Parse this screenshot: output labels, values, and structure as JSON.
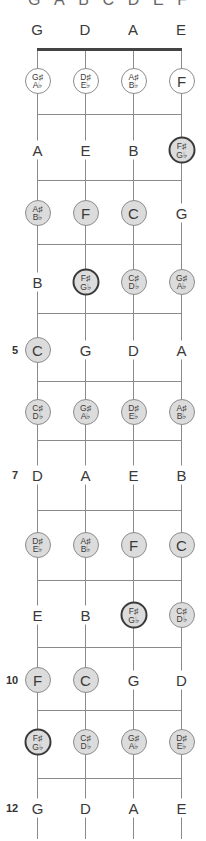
{
  "top_letters": [
    "G",
    "A",
    "B",
    "C",
    "D",
    "E",
    "F"
  ],
  "strings": [
    {
      "name": "G",
      "x": 37
    },
    {
      "name": "D",
      "x": 85
    },
    {
      "name": "A",
      "x": 133
    },
    {
      "name": "E",
      "x": 181
    }
  ],
  "open_strings": [
    "G",
    "D",
    "A",
    "E"
  ],
  "fret_lines_y": [
    114,
    180,
    244,
    313,
    381,
    440,
    510,
    580,
    647,
    710,
    778
  ],
  "fret_markers": [
    {
      "fret": "5",
      "y": 350
    },
    {
      "fret": "7",
      "y": 475
    },
    {
      "fret": "10",
      "y": 680
    },
    {
      "fret": "12",
      "y": 808
    }
  ],
  "frets": [
    {
      "fret": 1,
      "y": 81,
      "notes": [
        {
          "label": "G♯/A♭",
          "sharp": "G♯",
          "flat": "A♭",
          "style": "open-circle"
        },
        {
          "label": "D♯/E♭",
          "sharp": "D♯",
          "flat": "E♭",
          "style": "open-circle"
        },
        {
          "label": "A♯/B♭",
          "sharp": "A♯",
          "flat": "B♭",
          "style": "open-circle"
        },
        {
          "label": "F",
          "style": "open-circle"
        }
      ]
    },
    {
      "fret": 2,
      "y": 150,
      "notes": [
        {
          "label": "A",
          "style": "plain"
        },
        {
          "label": "E",
          "style": "plain"
        },
        {
          "label": "B",
          "style": "plain"
        },
        {
          "label": "F♯/G♭",
          "sharp": "F♯",
          "flat": "G♭",
          "style": "bold-circle"
        }
      ]
    },
    {
      "fret": 3,
      "y": 213,
      "notes": [
        {
          "label": "A♯/B♭",
          "sharp": "A♯",
          "flat": "B♭",
          "style": "circle"
        },
        {
          "label": "F",
          "style": "circle"
        },
        {
          "label": "C",
          "style": "circle"
        },
        {
          "label": "G",
          "style": "plain"
        }
      ]
    },
    {
      "fret": 4,
      "y": 282,
      "notes": [
        {
          "label": "B",
          "style": "plain"
        },
        {
          "label": "F♯/G♭",
          "sharp": "F♯",
          "flat": "G♭",
          "style": "bold-circle"
        },
        {
          "label": "C♯/D♭",
          "sharp": "C♯",
          "flat": "D♭",
          "style": "circle"
        },
        {
          "label": "G♯/A♭",
          "sharp": "G♯",
          "flat": "A♭",
          "style": "circle"
        }
      ]
    },
    {
      "fret": 5,
      "y": 350,
      "notes": [
        {
          "label": "C",
          "style": "circle"
        },
        {
          "label": "G",
          "style": "plain"
        },
        {
          "label": "D",
          "style": "plain"
        },
        {
          "label": "A",
          "style": "plain"
        }
      ]
    },
    {
      "fret": 6,
      "y": 412,
      "notes": [
        {
          "label": "C♯/D♭",
          "sharp": "C♯",
          "flat": "D♭",
          "style": "circle"
        },
        {
          "label": "G♯/A♭",
          "sharp": "G♯",
          "flat": "A♭",
          "style": "circle"
        },
        {
          "label": "D♯/E♭",
          "sharp": "D♯",
          "flat": "E♭",
          "style": "circle"
        },
        {
          "label": "A♯/B♭",
          "sharp": "A♯",
          "flat": "B♭",
          "style": "circle"
        }
      ]
    },
    {
      "fret": 7,
      "y": 475,
      "notes": [
        {
          "label": "D",
          "style": "plain"
        },
        {
          "label": "A",
          "style": "plain"
        },
        {
          "label": "E",
          "style": "plain"
        },
        {
          "label": "B",
          "style": "plain"
        }
      ]
    },
    {
      "fret": 8,
      "y": 545,
      "notes": [
        {
          "label": "D♯/E♭",
          "sharp": "D♯",
          "flat": "E♭",
          "style": "circle"
        },
        {
          "label": "A♯/B♭",
          "sharp": "A♯",
          "flat": "B♭",
          "style": "circle"
        },
        {
          "label": "F",
          "style": "circle"
        },
        {
          "label": "C",
          "style": "circle"
        }
      ]
    },
    {
      "fret": 9,
      "y": 615,
      "notes": [
        {
          "label": "E",
          "style": "plain"
        },
        {
          "label": "B",
          "style": "plain"
        },
        {
          "label": "F♯/G♭",
          "sharp": "F♯",
          "flat": "G♭",
          "style": "bold-circle"
        },
        {
          "label": "C♯/D♭",
          "sharp": "C♯",
          "flat": "D♭",
          "style": "circle"
        }
      ]
    },
    {
      "fret": 10,
      "y": 680,
      "notes": [
        {
          "label": "F",
          "style": "circle"
        },
        {
          "label": "C",
          "style": "circle"
        },
        {
          "label": "G",
          "style": "plain"
        },
        {
          "label": "D",
          "style": "plain"
        }
      ]
    },
    {
      "fret": 11,
      "y": 742,
      "notes": [
        {
          "label": "F♯/G♭",
          "sharp": "F♯",
          "flat": "G♭",
          "style": "bold-circle"
        },
        {
          "label": "C♯/D♭",
          "sharp": "C♯",
          "flat": "D♭",
          "style": "circle"
        },
        {
          "label": "G♯/A♭",
          "sharp": "G♯",
          "flat": "A♭",
          "style": "circle"
        },
        {
          "label": "D♯/E♭",
          "sharp": "D♯",
          "flat": "E♭",
          "style": "circle"
        }
      ]
    },
    {
      "fret": 12,
      "y": 808,
      "notes": [
        {
          "label": "G",
          "style": "plain"
        },
        {
          "label": "D",
          "style": "plain"
        },
        {
          "label": "A",
          "style": "plain"
        },
        {
          "label": "E",
          "style": "plain"
        }
      ]
    }
  ],
  "colors": {
    "circle_fill": "#dcdcdc",
    "circle_border": "#8c8c8c",
    "bold_border": "#3a3a3a",
    "line": "#8a8a8a",
    "nut": "#444444"
  }
}
